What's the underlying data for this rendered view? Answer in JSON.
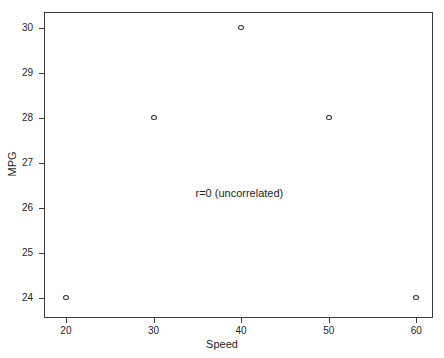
{
  "chart_data": {
    "type": "scatter",
    "title": "",
    "xlabel": "Speed",
    "ylabel": "MPG",
    "xlim": [
      17.5,
      61.9
    ],
    "ylim": [
      23.55,
      30.35
    ],
    "grid": false,
    "legend": null,
    "annotations": [
      {
        "text": "r=0 (uncorrelated)",
        "x": 39.8,
        "y": 26.3
      }
    ],
    "xticks": [
      20,
      30,
      40,
      50,
      60
    ],
    "xticklabels": [
      "20",
      "30",
      "40",
      "50",
      "60"
    ],
    "yticks": [
      24,
      25,
      26,
      27,
      28,
      29,
      30
    ],
    "yticklabels": [
      "24",
      "25",
      "26",
      "27",
      "28",
      "29",
      "30"
    ],
    "marker": "open-circle",
    "marker_color": "#2f2f2f",
    "x": [
      20,
      30,
      40,
      50,
      60
    ],
    "y": [
      24,
      28,
      30,
      28,
      24
    ],
    "points": [
      {
        "x": 20,
        "y": 24
      },
      {
        "x": 30,
        "y": 28
      },
      {
        "x": 40,
        "y": 30
      },
      {
        "x": 50,
        "y": 28
      },
      {
        "x": 60,
        "y": 24
      }
    ]
  },
  "figure": {
    "background_color": "#ffffff",
    "axes_color": "#3b3b3b"
  }
}
